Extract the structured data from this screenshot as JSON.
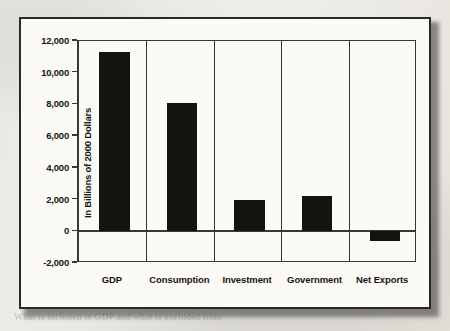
{
  "chart_data": {
    "type": "bar",
    "title": "",
    "xlabel": "",
    "ylabel": "In Billions of 2000 Dollars",
    "categories": [
      "GDP",
      "Consumption",
      "Investment",
      "Government",
      "Net Exports"
    ],
    "values": [
      11300,
      8100,
      1950,
      2200,
      -600
    ],
    "ylim": [
      -2000,
      12000
    ],
    "ytick_values": [
      12000,
      10000,
      8000,
      6000,
      4000,
      2000,
      0,
      -2000
    ],
    "ytick_labels": [
      "12,000",
      "10,000",
      "8,000",
      "6,000",
      "4,000",
      "2,000",
      "0",
      "-2,000"
    ],
    "grid": false,
    "legend": null,
    "bar_color": "#15130f",
    "axis_color": "#3a3733"
  },
  "page_background": {
    "ghost_lines": [
      "the value of the final good or service produced",
      "economy, the amount of income earned producing",
      "the total output of GDP. Because the economy",
      "every transaction, the expenditure approach and",
      "produce the same national income accounting",
      "in a good or service, it is important to note",
      "the value of output of the final goods and services"
    ],
    "ghost_heading": "GDP as a Measure of Output",
    "ghost_lines_lower": [
      "In a closed economy, firms hire inputs and",
      "summing of the expenditure approach has the",
      "and be accounted for in the final total income"
    ],
    "ghost_footer": "What is included in GDP and what is excluded from"
  }
}
